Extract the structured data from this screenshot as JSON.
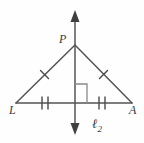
{
  "figure": {
    "background_color": "#fefefe",
    "stroke_color": "#545454",
    "label_color": "#3a3a3a",
    "width": 144,
    "height": 143
  },
  "labels": {
    "apex": "P",
    "left_vertex": "L",
    "right_vertex": "A",
    "line_name": "ℓ",
    "line_subscript": "2"
  },
  "geometry": {
    "points": {
      "P": {
        "x": 75,
        "y": 45
      },
      "L": {
        "x": 16,
        "y": 103
      },
      "A": {
        "x": 132,
        "y": 103
      },
      "M": {
        "x": 75,
        "y": 103
      }
    },
    "line_l2": {
      "x": 75,
      "y_top_tip": 11,
      "y_bottom_tip": 134,
      "arrow_top": true,
      "arrow_bottom": true
    },
    "right_angle_marker": {
      "at": "M",
      "size": 12,
      "side": "right"
    },
    "tick_marks": {
      "leg_LP": 1,
      "leg_PA": 1,
      "base_LM": 2,
      "base_MA": 2
    }
  }
}
